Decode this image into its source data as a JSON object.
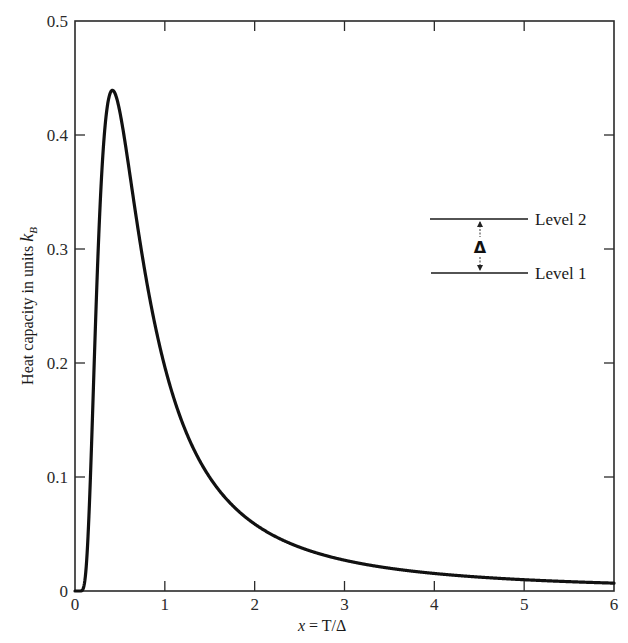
{
  "chart_data": {
    "type": "line",
    "title": "",
    "xlabel": "x = T/Δ",
    "ylabel": "Heat capacity in units k_B",
    "xlim": [
      0,
      6
    ],
    "ylim": [
      0,
      0.5
    ],
    "grid": false,
    "x_ticks": [
      "0",
      "1",
      "2",
      "3",
      "4",
      "5",
      "6"
    ],
    "y_ticks": [
      "0",
      "0.1",
      "0.2",
      "0.3",
      "0.4",
      "0.5"
    ],
    "series": [
      {
        "name": "Two-level system heat capacity (Schottky anomaly)",
        "x": [
          0,
          0.1,
          0.2,
          0.3,
          0.4,
          0.42,
          0.5,
          0.6,
          0.8,
          1.0,
          1.5,
          2.0,
          2.5,
          3.0,
          4.0,
          5.0,
          6.0
        ],
        "y": [
          0,
          0.0045,
          0.166,
          0.37,
          0.434,
          0.439,
          0.42,
          0.371,
          0.27,
          0.197,
          0.1,
          0.059,
          0.039,
          0.027,
          0.015,
          0.01,
          0.007
        ]
      }
    ],
    "peak": {
      "x": 0.42,
      "y": 0.44
    },
    "inset": {
      "levels": [
        "Level 2",
        "Level 1"
      ],
      "gap_label": "Δ"
    }
  },
  "labels": {
    "xlabel_italic": "x",
    "xlabel_rest": " = T/Δ",
    "ylabel_main": "Heat capacity in units ",
    "ylabel_k": "k",
    "ylabel_sub": "B",
    "level2": "Level 2",
    "level1": "Level 1",
    "delta": "Δ"
  },
  "ticks": {
    "x": [
      "0",
      "1",
      "2",
      "3",
      "4",
      "5",
      "6"
    ],
    "y": [
      "0",
      "0.1",
      "0.2",
      "0.3",
      "0.4",
      "0.5"
    ]
  }
}
